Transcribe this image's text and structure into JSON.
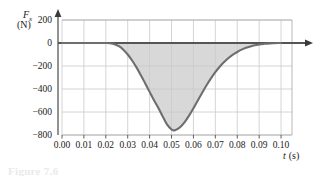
{
  "figure": {
    "caption_partial": "Figure 7.6"
  },
  "axes": {
    "y_label_symbol": "F",
    "y_label_subscript": "x",
    "y_label_unit": "(N)",
    "x_label_symbol": "t",
    "x_label_unit": "(s)"
  },
  "chart_data": {
    "type": "area",
    "title": "",
    "subtitle": "",
    "xlabel": "t (s)",
    "ylabel": "Fx (N)",
    "grid": true,
    "legend": null,
    "xlim": [
      0.0,
      0.105
    ],
    "ylim": [
      -800,
      200
    ],
    "xticks": [
      "0.00",
      "0.01",
      "0.02",
      "0.03",
      "0.04",
      "0.05",
      "0.06",
      "0.07",
      "0.08",
      "0.09",
      "0.10"
    ],
    "xtick_values": [
      0.0,
      0.01,
      0.02,
      0.03,
      0.04,
      0.05,
      0.06,
      0.07,
      0.08,
      0.09,
      0.1
    ],
    "yticks": [
      "200",
      "0",
      "-200",
      "-400",
      "-600",
      "-800"
    ],
    "ytick_values": [
      200,
      0,
      -200,
      -400,
      -600,
      -800
    ],
    "series": [
      {
        "name": "Fx(t)",
        "color": "#6e6e6e",
        "fill_color": "#d8d8d8",
        "fill_to": 0,
        "x": [
          0.0,
          0.005,
          0.01,
          0.015,
          0.02,
          0.022,
          0.024,
          0.026,
          0.028,
          0.03,
          0.032,
          0.034,
          0.036,
          0.038,
          0.04,
          0.042,
          0.044,
          0.046,
          0.048,
          0.05,
          0.051,
          0.052,
          0.054,
          0.056,
          0.058,
          0.06,
          0.062,
          0.064,
          0.066,
          0.068,
          0.07,
          0.072,
          0.074,
          0.076,
          0.078,
          0.08,
          0.082,
          0.084,
          0.086,
          0.088,
          0.09,
          0.092,
          0.095,
          0.1
        ],
        "y": [
          0,
          0,
          0,
          0,
          0,
          -2,
          -10,
          -28,
          -58,
          -100,
          -152,
          -212,
          -280,
          -352,
          -425,
          -497,
          -565,
          -640,
          -710,
          -752,
          -760,
          -756,
          -730,
          -688,
          -632,
          -568,
          -500,
          -432,
          -368,
          -308,
          -254,
          -207,
          -166,
          -131,
          -102,
          -78,
          -58,
          -42,
          -30,
          -20,
          -13,
          -8,
          -3,
          0
        ]
      }
    ],
    "annotations": [
      {
        "text": "minimum force",
        "x": 0.051,
        "y": -760,
        "shown": false
      }
    ]
  },
  "colors": {
    "curve": "#6e6e6e",
    "shaded_area": "#d8d8d8",
    "gridline": "#c9c9c9",
    "axis_line": "#555555",
    "plot_border": "#b5b5b5",
    "text": "#1a1a1a"
  }
}
